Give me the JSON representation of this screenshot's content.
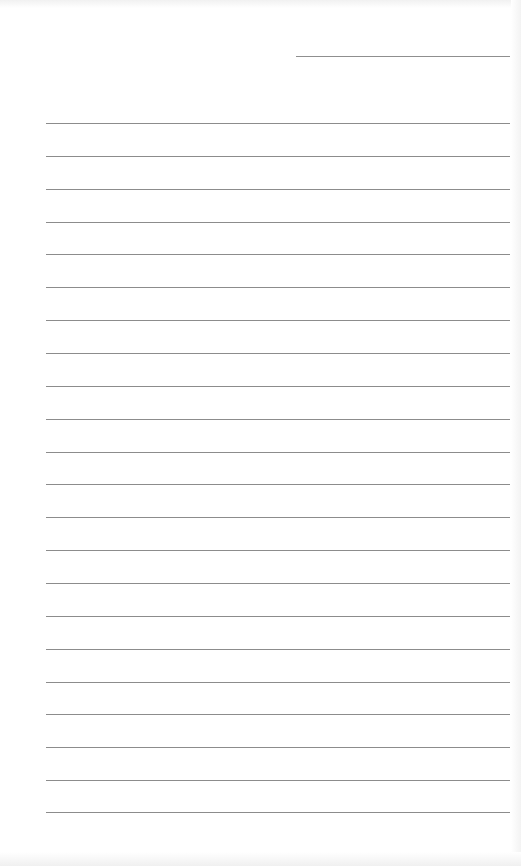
{
  "document": {
    "type": "lined-paper",
    "header_line": {
      "label": ""
    },
    "line_color": "#8c8c8c",
    "background": "#ffffff",
    "lines": [
      {
        "y": 123,
        "text": ""
      },
      {
        "y": 156,
        "text": ""
      },
      {
        "y": 189,
        "text": ""
      },
      {
        "y": 222,
        "text": ""
      },
      {
        "y": 254,
        "text": ""
      },
      {
        "y": 287,
        "text": ""
      },
      {
        "y": 320,
        "text": ""
      },
      {
        "y": 353,
        "text": ""
      },
      {
        "y": 386,
        "text": ""
      },
      {
        "y": 419,
        "text": ""
      },
      {
        "y": 452,
        "text": ""
      },
      {
        "y": 484,
        "text": ""
      },
      {
        "y": 517,
        "text": ""
      },
      {
        "y": 550,
        "text": ""
      },
      {
        "y": 583,
        "text": ""
      },
      {
        "y": 616,
        "text": ""
      },
      {
        "y": 649,
        "text": ""
      },
      {
        "y": 682,
        "text": ""
      },
      {
        "y": 714,
        "text": ""
      },
      {
        "y": 747,
        "text": ""
      },
      {
        "y": 780,
        "text": ""
      },
      {
        "y": 812,
        "text": ""
      }
    ]
  }
}
